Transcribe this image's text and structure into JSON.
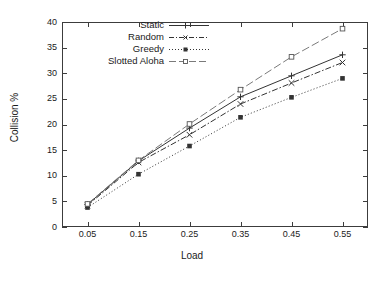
{
  "chart_data": {
    "type": "line",
    "title": "",
    "xlabel": "Load",
    "ylabel": "Collision %",
    "x": [
      0.05,
      0.15,
      0.25,
      0.35,
      0.45,
      0.55
    ],
    "xtick_labels": [
      "0.05",
      "0.15",
      "0.25",
      "0.35",
      "0.45",
      "0.55"
    ],
    "ytick_labels": [
      "0",
      "5",
      "10",
      "15",
      "20",
      "25",
      "30",
      "35",
      "40"
    ],
    "yticks": [
      0,
      5,
      10,
      15,
      20,
      25,
      30,
      35,
      40
    ],
    "xlim": [
      0.0,
      0.6
    ],
    "ylim": [
      0,
      40
    ],
    "grid": false,
    "legend_position": "upper-left",
    "series": [
      {
        "name": "Static",
        "values": [
          4.4,
          12.9,
          19.3,
          25.4,
          29.5,
          33.6
        ],
        "marker": "plus",
        "dash": "none",
        "color": "#333333"
      },
      {
        "name": "Random",
        "values": [
          4.2,
          12.6,
          18.0,
          24.0,
          28.1,
          32.1
        ],
        "marker": "cross",
        "dash": "dashdot",
        "color": "#333333"
      },
      {
        "name": "Greedy",
        "values": [
          3.8,
          10.3,
          15.8,
          21.4,
          25.3,
          29.0
        ],
        "marker": "square-filled",
        "dash": "dotted",
        "color": "#333333"
      },
      {
        "name": "Slotted Aloha",
        "values": [
          4.5,
          13.0,
          20.1,
          26.8,
          33.2,
          38.7
        ],
        "marker": "square-open",
        "dash": "longdash",
        "color": "#7a7a7a"
      }
    ]
  },
  "legend": {
    "items": [
      {
        "label": "Static"
      },
      {
        "label": "Random"
      },
      {
        "label": "Greedy"
      },
      {
        "label": "Slotted Aloha"
      }
    ]
  },
  "axes": {
    "x_title": "Load",
    "y_title": "Collision %"
  }
}
